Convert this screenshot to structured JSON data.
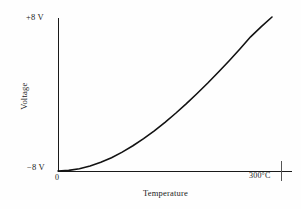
{
  "figure": {
    "background_color": "#fefefe",
    "axis_color": "#1a1a1a",
    "curve_color": "#121212"
  },
  "chart_data": {
    "type": "line",
    "title": "",
    "xlabel": "Temperature",
    "ylabel": "Voltage",
    "xlim": [
      0,
      300
    ],
    "ylim": [
      -8,
      8
    ],
    "grid": false,
    "legend": null,
    "x_tick_labels": [
      "0",
      "300°C"
    ],
    "x_tick_values": [
      0,
      300
    ],
    "y_tick_labels": [
      "−8 V",
      "+8 V"
    ],
    "y_tick_values": [
      -8,
      8
    ],
    "x_unit": "°C",
    "y_unit": "V",
    "series": [
      {
        "name": "Voltage vs Temperature",
        "x": [
          0,
          15,
          30,
          45,
          60,
          75,
          90,
          105,
          120,
          135,
          150,
          165,
          180,
          195,
          210,
          225,
          240,
          255,
          270,
          285,
          300
        ],
        "y": [
          -8.0,
          -7.93,
          -7.76,
          -7.48,
          -7.1,
          -6.62,
          -6.04,
          -5.38,
          -4.64,
          -3.82,
          -2.94,
          -2.0,
          -1.0,
          0.05,
          1.14,
          2.28,
          3.46,
          4.68,
          5.94,
          7.0,
          8.0
        ]
      }
    ]
  },
  "annotations": {
    "y_top_label": "+8 V",
    "y_bottom_label": "−8 V",
    "x_zero_label": "0",
    "x_max_label": "300°C",
    "x_axis_title": "Temperature",
    "y_axis_title": "Voltage"
  }
}
